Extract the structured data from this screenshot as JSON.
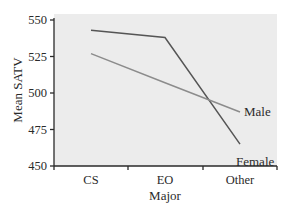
{
  "chart_data": {
    "type": "line",
    "title": "",
    "xlabel": "Major",
    "ylabel": "Mean SATV",
    "categories": [
      "CS",
      "EO",
      "Other"
    ],
    "ylim": [
      450,
      550
    ],
    "yticks": [
      450,
      475,
      500,
      525,
      550
    ],
    "grid": false,
    "legend_position": "inline labels at line ends",
    "series": [
      {
        "name": "Female",
        "values": [
          543,
          538,
          465
        ],
        "color": "#555555"
      },
      {
        "name": "Male",
        "values": [
          527,
          507,
          487
        ],
        "color": "#8c8c8c"
      }
    ]
  },
  "colors": {
    "plot_background": "#ececec",
    "axis": "#2a2a2a"
  }
}
